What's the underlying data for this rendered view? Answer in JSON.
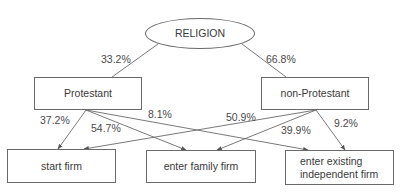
{
  "diagram": {
    "root": {
      "label": "RELIGION"
    },
    "groups": [
      {
        "label": "Protestant",
        "share": "33.2%"
      },
      {
        "label": "non-Protestant",
        "share": "66.8%"
      }
    ],
    "outcomes": [
      {
        "label": "start firm"
      },
      {
        "label": "enter family firm"
      },
      {
        "label": "enter existing independent firm"
      }
    ],
    "edges": {
      "protestant": {
        "start_firm": "37.2%",
        "enter_family_firm": "54.7%",
        "enter_existing_independent_firm": "8.1%"
      },
      "non_protestant": {
        "start_firm": "50.9%",
        "enter_family_firm": "39.9%",
        "enter_existing_independent_firm": "9.2%"
      }
    },
    "colors": {
      "line": "#6a6a6a",
      "text": "#3a3a3a"
    }
  }
}
